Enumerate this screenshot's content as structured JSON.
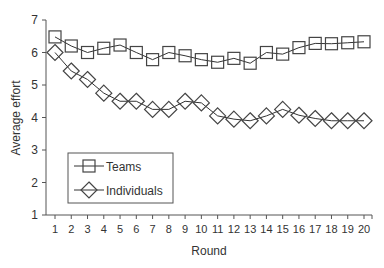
{
  "chart_data": {
    "type": "line",
    "title": "",
    "xlabel": "Round",
    "ylabel": "Average effort",
    "x": [
      1,
      2,
      3,
      4,
      5,
      6,
      7,
      8,
      9,
      10,
      11,
      12,
      13,
      14,
      15,
      16,
      17,
      18,
      19,
      20
    ],
    "xticks": [
      "1",
      "2",
      "3",
      "4",
      "5",
      "6",
      "7",
      "8",
      "9",
      "10",
      "11",
      "12",
      "13",
      "14",
      "15",
      "16",
      "17",
      "18",
      "19",
      "20"
    ],
    "yticks": [
      "1",
      "2",
      "3",
      "4",
      "5",
      "6",
      "7"
    ],
    "ylim": [
      1,
      7
    ],
    "xlim": [
      1,
      20
    ],
    "grid": false,
    "legend_position": "lower-left inside",
    "series": [
      {
        "name": "Teams",
        "marker": "square",
        "values": [
          6.48,
          6.2,
          6.0,
          6.13,
          6.23,
          6.0,
          5.78,
          6.0,
          5.9,
          5.78,
          5.7,
          5.82,
          5.67,
          6.0,
          5.95,
          6.15,
          6.28,
          6.27,
          6.3,
          6.33
        ]
      },
      {
        "name": "Individuals",
        "marker": "diamond",
        "values": [
          6.0,
          5.43,
          5.17,
          4.75,
          4.5,
          4.5,
          4.25,
          4.25,
          4.5,
          4.45,
          4.05,
          3.95,
          3.9,
          4.05,
          4.25,
          4.07,
          3.97,
          3.9,
          3.9,
          3.9
        ]
      }
    ]
  },
  "colors": {
    "line": "#333333",
    "axis": "#555555",
    "text": "#333333",
    "background": "#ffffff"
  }
}
